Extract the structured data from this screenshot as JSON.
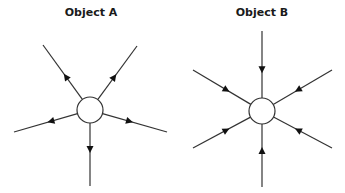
{
  "diagram": {
    "object_a": {
      "title": "Object A",
      "center": [
        90,
        110
      ],
      "radius": 13,
      "arrow_direction": "outward",
      "rays": [
        {
          "name": "upper-left",
          "end": [
            43,
            45
          ]
        },
        {
          "name": "upper-right",
          "end": [
            137,
            46
          ]
        },
        {
          "name": "left",
          "end": [
            14,
            132
          ]
        },
        {
          "name": "right",
          "end": [
            167,
            132
          ]
        },
        {
          "name": "down",
          "end": [
            90,
            186
          ]
        }
      ]
    },
    "object_b": {
      "title": "Object B",
      "center": [
        262,
        111
      ],
      "radius": 13,
      "arrow_direction": "inward",
      "rays": [
        {
          "name": "up",
          "end": [
            262,
            31
          ]
        },
        {
          "name": "upper-left",
          "end": [
            193,
            70
          ]
        },
        {
          "name": "upper-right",
          "end": [
            332,
            70
          ]
        },
        {
          "name": "lower-left",
          "end": [
            193,
            148
          ]
        },
        {
          "name": "lower-right",
          "end": [
            332,
            148
          ]
        },
        {
          "name": "down",
          "end": [
            262,
            187
          ]
        }
      ]
    },
    "colors": {
      "line": "#333333",
      "circle_fill": "#ffffff"
    }
  }
}
